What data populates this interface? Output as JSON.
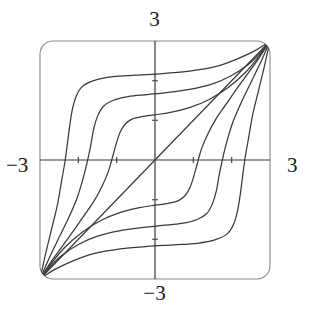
{
  "figure": {
    "title": "",
    "background_color": "#ffffff",
    "frame_color": "#8a8a8a",
    "axis_color": "#3a3a3a",
    "curve_color": "#3a3a3a",
    "label_color": "#1a1a1a"
  },
  "labels": {
    "top": "3",
    "bottom": "−3",
    "left": "−3",
    "right": "3"
  },
  "chart_data": {
    "type": "line",
    "title": "",
    "subtitle": "",
    "xlabel": "",
    "ylabel": "",
    "xlim": [
      -3,
      3
    ],
    "ylim": [
      -3,
      3
    ],
    "xticks": [
      -3,
      -2,
      -1,
      0,
      1,
      2,
      3
    ],
    "yticks": [
      -3,
      -2,
      -1,
      0,
      1,
      2,
      3
    ],
    "xticklabels": [
      "-3",
      "",
      "",
      "",
      "",
      "",
      "3"
    ],
    "yticklabels": [
      "-3",
      "",
      "",
      "",
      "",
      "",
      "3"
    ],
    "grid": false,
    "legend": false,
    "legend_position": "none",
    "axes_style": "centered-crosshair",
    "frame": "rounded-rectangle",
    "annotations": [
      "Axis endpoint labels 3 and -3 placed outside the plot frame at top, bottom, left and right",
      "Small tick marks at +/-1 and +/-2 on both axes",
      "Contour family is symmetric about the line y = x and about the origin",
      "All curves converge toward the bottom-left and top-right corners of the frame"
    ],
    "series": [
      {
        "name": "level 0 (y = x)",
        "type": "line",
        "x": [
          -3,
          3
        ],
        "y": [
          -3,
          3
        ]
      },
      {
        "name": "level +1 (upper-left, innermost)",
        "type": "line",
        "x": [
          -3.0,
          -2.7,
          -2.4,
          -2.1,
          -1.85,
          -1.6,
          -1.4,
          -1.22,
          -1.1,
          -1.0,
          -0.9,
          -0.78,
          -0.6,
          -0.3,
          0.0,
          0.4,
          0.9,
          1.4,
          1.9,
          2.35,
          2.7,
          3.0
        ],
        "y": [
          -3.0,
          -2.55,
          -2.15,
          -1.75,
          -1.4,
          -1.05,
          -0.7,
          -0.3,
          0.1,
          0.45,
          0.72,
          0.9,
          1.03,
          1.1,
          1.14,
          1.2,
          1.32,
          1.52,
          1.82,
          2.2,
          2.6,
          3.0
        ]
      },
      {
        "name": "level +2 (upper-left, middle)",
        "type": "line",
        "x": [
          -3.0,
          -2.75,
          -2.5,
          -2.25,
          -2.05,
          -1.9,
          -1.78,
          -1.68,
          -1.6,
          -1.5,
          -1.35,
          -1.1,
          -0.7,
          -0.2,
          0.3,
          0.9,
          1.5,
          2.0,
          2.45,
          2.75,
          3.0
        ],
        "y": [
          -3.0,
          -2.45,
          -1.95,
          -1.45,
          -1.0,
          -0.55,
          -0.1,
          0.35,
          0.78,
          1.1,
          1.35,
          1.5,
          1.6,
          1.65,
          1.7,
          1.78,
          1.92,
          2.13,
          2.42,
          2.7,
          3.0
        ]
      },
      {
        "name": "level +3 (upper-left, outermost)",
        "type": "line",
        "x": [
          -3.0,
          -2.85,
          -2.7,
          -2.55,
          -2.45,
          -2.35,
          -2.28,
          -2.22,
          -2.15,
          -2.05,
          -1.9,
          -1.6,
          -1.1,
          -0.5,
          0.2,
          0.9,
          1.6,
          2.15,
          2.6,
          2.85,
          3.0
        ],
        "y": [
          -3.0,
          -2.35,
          -1.75,
          -1.15,
          -0.6,
          -0.05,
          0.45,
          0.9,
          1.3,
          1.62,
          1.85,
          2.0,
          2.1,
          2.14,
          2.18,
          2.24,
          2.36,
          2.55,
          2.75,
          2.9,
          3.0
        ]
      },
      {
        "name": "level -1 (lower-right, innermost)",
        "type": "line",
        "x": [
          3.0,
          2.7,
          2.4,
          2.1,
          1.85,
          1.6,
          1.4,
          1.22,
          1.1,
          1.0,
          0.9,
          0.78,
          0.6,
          0.3,
          0.0,
          -0.4,
          -0.9,
          -1.4,
          -1.9,
          -2.35,
          -2.7,
          -3.0
        ],
        "y": [
          3.0,
          2.55,
          2.15,
          1.75,
          1.4,
          1.05,
          0.7,
          0.3,
          -0.1,
          -0.45,
          -0.72,
          -0.9,
          -1.03,
          -1.1,
          -1.14,
          -1.2,
          -1.32,
          -1.52,
          -1.82,
          -2.2,
          -2.6,
          -3.0
        ]
      },
      {
        "name": "level -2 (lower-right, middle)",
        "type": "line",
        "x": [
          3.0,
          2.75,
          2.5,
          2.25,
          2.05,
          1.9,
          1.78,
          1.68,
          1.6,
          1.5,
          1.35,
          1.1,
          0.7,
          0.2,
          -0.3,
          -0.9,
          -1.5,
          -2.0,
          -2.45,
          -2.75,
          -3.0
        ],
        "y": [
          3.0,
          2.45,
          1.95,
          1.45,
          1.0,
          0.55,
          0.1,
          -0.35,
          -0.78,
          -1.1,
          -1.35,
          -1.5,
          -1.6,
          -1.65,
          -1.7,
          -1.78,
          -1.92,
          -2.13,
          -2.42,
          -2.7,
          -3.0
        ]
      },
      {
        "name": "level -3 (lower-right, outermost)",
        "type": "line",
        "x": [
          3.0,
          2.85,
          2.7,
          2.55,
          2.45,
          2.35,
          2.28,
          2.22,
          2.15,
          2.05,
          1.9,
          1.6,
          1.1,
          0.5,
          -0.2,
          -0.9,
          -1.6,
          -2.15,
          -2.6,
          -2.85,
          -3.0
        ],
        "y": [
          3.0,
          2.35,
          1.75,
          1.15,
          0.6,
          0.05,
          -0.45,
          -0.9,
          -1.3,
          -1.62,
          -1.85,
          -2.0,
          -2.1,
          -2.14,
          -2.18,
          -2.24,
          -2.36,
          -2.55,
          -2.75,
          -2.9,
          -3.0
        ]
      }
    ]
  }
}
